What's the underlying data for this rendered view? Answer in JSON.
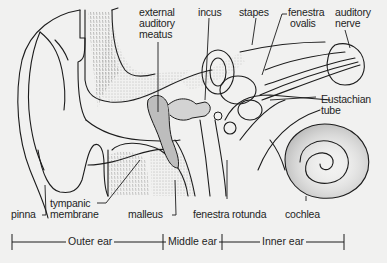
{
  "diagram": {
    "type": "anatomical-cross-section",
    "labels": {
      "external_auditory_meatus": "external\nauditory\nmeatus",
      "external_auditory_meatus_lines": [
        "external",
        "auditory",
        "meatus"
      ],
      "incus": "incus",
      "stapes": "stapes",
      "fenestra_ovalis_lines": [
        "fenestra",
        "ovalis"
      ],
      "auditory_nerve_lines": [
        "auditory",
        "nerve"
      ],
      "eustachian_tube_lines": [
        "Eustachian",
        "tube"
      ],
      "pinna": "pinna",
      "tympanic_membrane_lines": [
        "tympanic",
        "membrane"
      ],
      "malleus": "malleus",
      "fenestra_rotunda": "fenestra rotunda",
      "cochlea": "cochlea"
    },
    "regions": [
      {
        "name": "Outer ear"
      },
      {
        "name": "Middle ear"
      },
      {
        "name": "Inner ear"
      }
    ],
    "colors": {
      "background": "#f1f1f0",
      "ink": "#1c1c1c",
      "shade": "#9a9a9a"
    }
  }
}
